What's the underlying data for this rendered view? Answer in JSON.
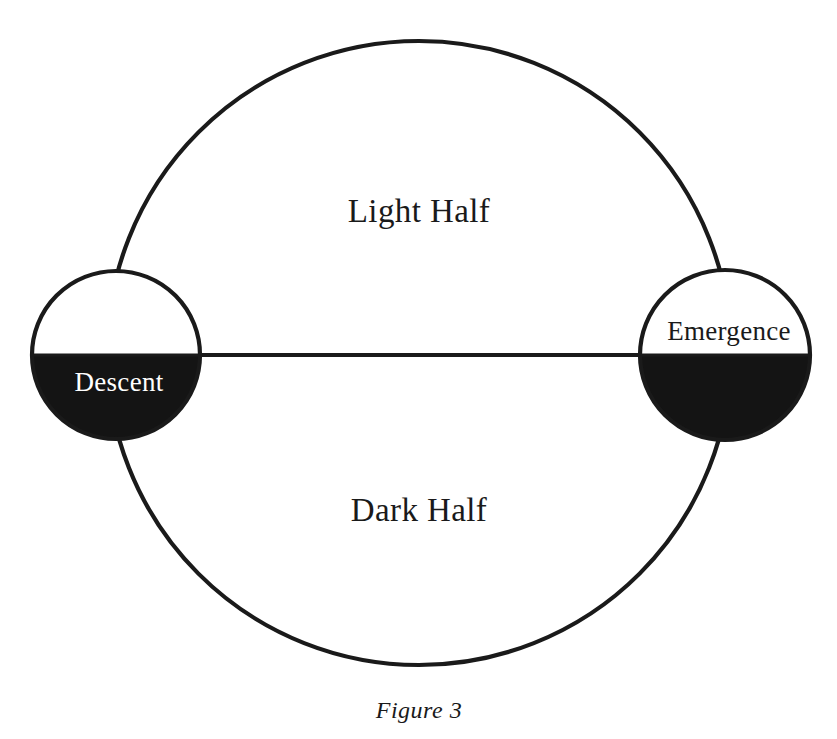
{
  "figure": {
    "caption": "Figure 3",
    "background_color": "#ffffff",
    "stroke_color": "#1a1a1a",
    "fill_dark_color": "#141414",
    "fill_light_color": "#ffffff"
  },
  "cycle": {
    "upper_half_label": "Light Half",
    "lower_half_label": "Dark Half"
  },
  "nodes": {
    "left": {
      "label": "Descent",
      "label_color": "#ffffff",
      "upper_half": "light",
      "lower_half": "dark"
    },
    "right": {
      "label": "Emergence",
      "label_color": "#1a1a1a",
      "upper_half": "light",
      "lower_half": "dark"
    }
  },
  "geometry": {
    "main_circle": {
      "cx": 419,
      "cy": 353,
      "r": 312
    },
    "left_node_circle": {
      "cx": 116,
      "cy": 355,
      "r": 84
    },
    "right_node_circle": {
      "cx": 725,
      "cy": 355,
      "r": 85
    },
    "horizontal_axis": {
      "x1": 190,
      "y1": 355,
      "x2": 642,
      "y2": 355
    }
  }
}
